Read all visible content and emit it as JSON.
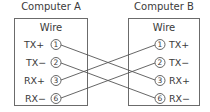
{
  "computer_a": {
    "title": "Computer A",
    "box_label": "Wire",
    "pins": [
      {
        "signal": "TX+",
        "number": "1"
      },
      {
        "signal": "TX−",
        "number": "2"
      },
      {
        "signal": "RX+",
        "number": "3"
      },
      {
        "signal": "RX−",
        "number": "6"
      }
    ]
  },
  "computer_b": {
    "title": "Computer B",
    "box_label": "Wire",
    "pins": [
      {
        "signal": "TX+",
        "number": "1"
      },
      {
        "signal": "TX−",
        "number": "2"
      },
      {
        "signal": "RX+",
        "number": "3"
      },
      {
        "signal": "RX−",
        "number": "6"
      }
    ]
  },
  "connections": [
    {
      "from": "A1 TX+",
      "to": "B3 RX+"
    },
    {
      "from": "A2 TX−",
      "to": "B6 RX−"
    },
    {
      "from": "A3 RX+",
      "to": "B1 TX+"
    },
    {
      "from": "A6 RX−",
      "to": "B2 TX−"
    }
  ],
  "colors": {
    "line": "#555555",
    "text": "#3a3a3a",
    "border": "#6b6b6b"
  }
}
